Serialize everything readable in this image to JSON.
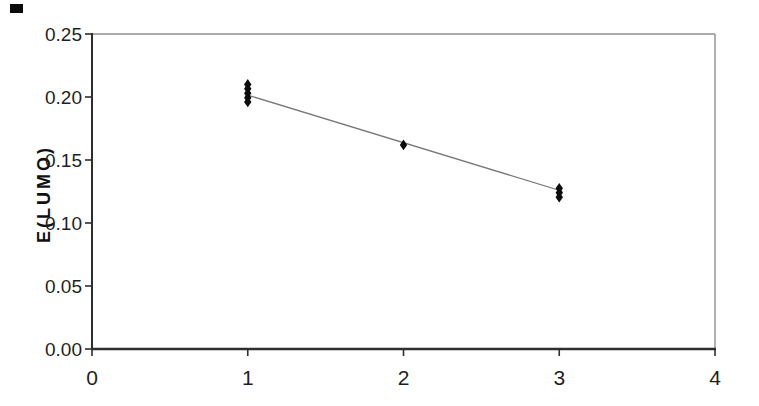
{
  "chart_data": {
    "type": "scatter",
    "title": "",
    "xlabel": "",
    "ylabel": "E(LUMO)",
    "xlim": [
      0,
      4
    ],
    "ylim": [
      0,
      0.25
    ],
    "grid": false,
    "legend": false,
    "x_ticks": [
      {
        "value": 0,
        "label": "0"
      },
      {
        "value": 1,
        "label": "1"
      },
      {
        "value": 2,
        "label": "2"
      },
      {
        "value": 3,
        "label": "3"
      },
      {
        "value": 4,
        "label": "4"
      }
    ],
    "y_ticks": [
      {
        "value": 0.0,
        "label": "0.00"
      },
      {
        "value": 0.05,
        "label": "0.05"
      },
      {
        "value": 0.1,
        "label": "0.10"
      },
      {
        "value": 0.15,
        "label": "0.15"
      },
      {
        "value": 0.2,
        "label": "0.20"
      },
      {
        "value": 0.25,
        "label": "0.25"
      }
    ],
    "series": [
      {
        "name": "E(LUMO) values",
        "marker": "diamond",
        "color": "#0d0d0d",
        "points": [
          {
            "x": 1,
            "y": 0.196
          },
          {
            "x": 1,
            "y": 0.1995
          },
          {
            "x": 1,
            "y": 0.203
          },
          {
            "x": 1,
            "y": 0.2065
          },
          {
            "x": 1,
            "y": 0.21
          },
          {
            "x": 2,
            "y": 0.162
          },
          {
            "x": 3,
            "y": 0.1205
          },
          {
            "x": 3,
            "y": 0.124
          },
          {
            "x": 3,
            "y": 0.1275
          }
        ]
      }
    ],
    "trendline": {
      "x1": 1.0,
      "y1": 0.2015,
      "x2": 3.02,
      "y2": 0.1252,
      "color": "#787878"
    },
    "colors": {
      "axis": "#2e2e2e",
      "border": "#8f8f8f",
      "label": "#1f1f1f",
      "background": "#ffffff"
    }
  }
}
